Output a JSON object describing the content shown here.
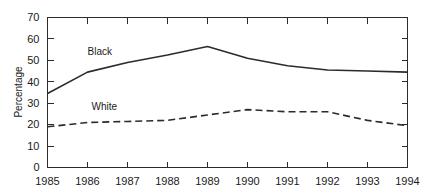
{
  "chart_data": {
    "type": "line",
    "title": "",
    "subtitle": "",
    "xlabel": "",
    "ylabel": "Percentage",
    "x": [
      1985,
      1986,
      1987,
      1988,
      1989,
      1990,
      1991,
      1992,
      1993,
      1994
    ],
    "xtick_labels": [
      "1985",
      "1986",
      "1987",
      "1988",
      "1989",
      "1990",
      "1991",
      "1992",
      "1993",
      "1994"
    ],
    "ytick_labels": [
      "0",
      "10",
      "20",
      "30",
      "40",
      "50",
      "60",
      "70"
    ],
    "yticks": [
      0,
      10,
      20,
      30,
      40,
      50,
      60,
      70
    ],
    "ylim": [
      0,
      70
    ],
    "xlim": [
      1985,
      1994
    ],
    "grid": false,
    "legend_position": "inline-annotations",
    "series": [
      {
        "name": "Black",
        "style": "solid",
        "color": "#2b2b2b",
        "label_x": 1986.0,
        "label_y": 52.5,
        "values": [
          34.5,
          44.5,
          49.0,
          52.5,
          56.5,
          51.0,
          47.5,
          45.5,
          45.0,
          44.5
        ]
      },
      {
        "name": "White",
        "style": "dashed",
        "color": "#2b2b2b",
        "label_x": 1986.1,
        "label_y": 27.0,
        "values": [
          19.0,
          21.0,
          21.5,
          22.0,
          24.5,
          27.0,
          26.0,
          26.0,
          22.0,
          19.5
        ]
      }
    ]
  },
  "annotations": {
    "black_label": "Black",
    "white_label": "White"
  }
}
